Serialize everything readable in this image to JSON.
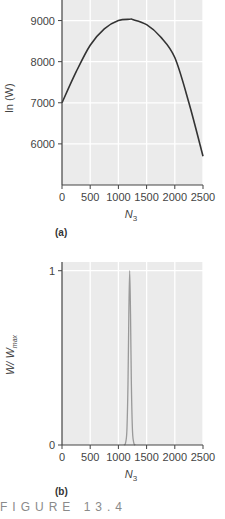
{
  "figure_caption": "FIGURE 13.4",
  "chart_data": [
    {
      "panel": "(a)",
      "type": "line",
      "title": "",
      "xlabel": "N_3",
      "xlabel_main": "N",
      "xlabel_sub": "3",
      "ylabel": "ln (W)",
      "xlim": [
        0,
        2500
      ],
      "ylim": [
        5000,
        9500
      ],
      "xticks": [
        0,
        500,
        1000,
        1500,
        2000,
        2500
      ],
      "yticks": [
        6000,
        7000,
        8000,
        9000
      ],
      "grid": true,
      "series": [
        {
          "name": "ln(W)",
          "color": "#333333",
          "x": [
            0,
            250,
            500,
            750,
            1000,
            1200,
            1250,
            1500,
            1750,
            2000,
            2250,
            2500
          ],
          "y": [
            7000,
            7750,
            8400,
            8800,
            9000,
            9030,
            9025,
            8900,
            8600,
            8100,
            7000,
            5700
          ]
        }
      ]
    },
    {
      "panel": "(b)",
      "type": "line",
      "title": "",
      "xlabel": "N_3",
      "xlabel_main": "N",
      "xlabel_sub": "3",
      "ylabel": "W/W_max",
      "ylabel_main": "W/ W",
      "ylabel_sub": "max",
      "xlim": [
        0,
        2500
      ],
      "ylim": [
        0,
        1.05
      ],
      "xticks": [
        0,
        500,
        1000,
        1500,
        2000,
        2500
      ],
      "yticks": [
        0,
        1
      ],
      "grid": true,
      "series": [
        {
          "name": "W/Wmax",
          "color": "#999999",
          "x": [
            1100,
            1125,
            1150,
            1170,
            1185,
            1200,
            1215,
            1230,
            1250,
            1275,
            1300
          ],
          "y": [
            0,
            0.01,
            0.08,
            0.35,
            0.75,
            1.0,
            0.75,
            0.35,
            0.08,
            0.01,
            0
          ]
        }
      ]
    }
  ]
}
